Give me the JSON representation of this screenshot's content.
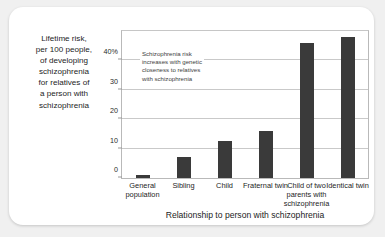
{
  "caption": {
    "lines": [
      "Lifetime risk,",
      "per 100 people,",
      "of developing",
      "schizophrenia",
      "for relatives of",
      "a person with",
      "schizophrenia"
    ]
  },
  "annotation": {
    "text": "Schizophrenia risk increases with genetic closeness to relatives with schizophrenia"
  },
  "colors": {
    "bar": "#3a3a3a",
    "grid": "#c9c9c9",
    "frame": "#b9b9b9",
    "page_background": "#f0f0f0",
    "card_background": "#ffffff",
    "text": "#1d1d1d"
  },
  "chart_data": {
    "type": "bar",
    "title": "",
    "xlabel": "Relationship to person with schizophrenia",
    "ylabel": "Lifetime risk, per 100 people, of developing schizophrenia for relatives of a person with schizophrenia",
    "categories": [
      "General population",
      "Sibling",
      "Child",
      "Fraternal twin",
      "Child of two parents with schizophrenia",
      "Identical twin"
    ],
    "values": [
      1,
      7,
      12.5,
      16,
      46,
      48
    ],
    "ylim": [
      0,
      50
    ],
    "yticks": [
      0,
      10,
      20,
      30,
      40
    ],
    "ytick_labels": [
      "0",
      "10",
      "20",
      "30",
      "40%"
    ],
    "grid": true,
    "legend": false,
    "annotations": [
      "Schizophrenia risk increases with genetic closeness to relatives with schizophrenia"
    ]
  }
}
